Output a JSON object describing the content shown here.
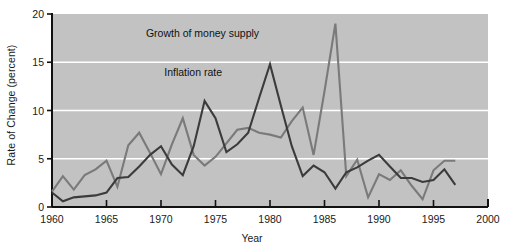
{
  "chart_data": {
    "type": "line",
    "title": "",
    "xlabel": "Year",
    "ylabel": "Rate of Change (percent)",
    "xlim": [
      1960,
      2000
    ],
    "ylim": [
      0,
      20
    ],
    "xticks": [
      1960,
      1965,
      1970,
      1975,
      1980,
      1985,
      1990,
      1995,
      2000
    ],
    "xtick_labels": [
      "1960",
      "1965",
      "1970",
      "1975",
      "1980",
      "1985",
      "1990",
      "1995",
      "2000"
    ],
    "yticks": [
      0,
      5,
      10,
      15,
      20
    ],
    "ytick_labels": [
      "0",
      "5",
      "10",
      "15",
      "20"
    ],
    "grid": "horizontal-white",
    "plot_background": "#c2c2c2",
    "legend_position": "inline-annotations",
    "annotations": [
      {
        "text": "Growth of money supply",
        "x": 1979.0,
        "y": 17.6,
        "anchor": "end"
      },
      {
        "text": "Inflation rate",
        "x": 1975.6,
        "y": 13.6,
        "anchor": "end"
      }
    ],
    "x": [
      1960,
      1961,
      1962,
      1963,
      1964,
      1965,
      1966,
      1967,
      1968,
      1969,
      1970,
      1971,
      1972,
      1973,
      1974,
      1975,
      1976,
      1977,
      1978,
      1979,
      1980,
      1981,
      1982,
      1983,
      1984,
      1985,
      1986,
      1987,
      1988,
      1989,
      1990,
      1991,
      1992,
      1993,
      1994,
      1995,
      1996,
      1997
    ],
    "series": [
      {
        "name": "Growth of money supply",
        "color": "#7a7a7a",
        "values": [
          1.6,
          3.2,
          1.8,
          3.3,
          3.9,
          4.8,
          2.1,
          6.4,
          7.7,
          5.6,
          3.4,
          6.5,
          9.2,
          5.4,
          4.3,
          5.2,
          6.6,
          8.0,
          8.2,
          7.7,
          7.5,
          7.2,
          8.9,
          10.3,
          5.4,
          12.0,
          19.0,
          3.2,
          4.9,
          1.0,
          3.4,
          2.8,
          3.8,
          2.2,
          0.8,
          3.8,
          4.8,
          4.8
        ]
      },
      {
        "name": "Inflation rate",
        "color": "#3b3b3b",
        "values": [
          1.5,
          0.6,
          1.0,
          1.1,
          1.2,
          1.5,
          3.0,
          3.1,
          4.2,
          5.4,
          6.3,
          4.4,
          3.3,
          6.3,
          11.0,
          9.2,
          5.7,
          6.5,
          7.7,
          11.3,
          14.8,
          10.5,
          6.3,
          3.2,
          4.3,
          3.6,
          1.9,
          3.6,
          4.1,
          4.8,
          5.4,
          4.2,
          3.0,
          3.0,
          2.6,
          2.8,
          3.9,
          2.3
        ]
      }
    ]
  }
}
